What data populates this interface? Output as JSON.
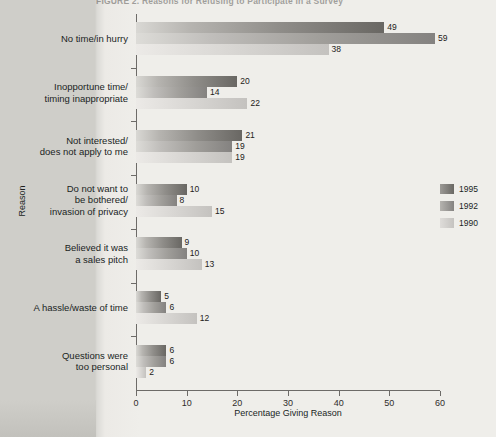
{
  "figure": {
    "title": "FIGURE 2.  Reasons for Refusing to Participate in a Survey",
    "title_clipped": true
  },
  "chart_data": {
    "type": "bar",
    "orientation": "horizontal",
    "title": "FIGURE 2.  Reasons for Refusing to Participate in a Survey",
    "xlabel": "Percentage Giving Reason",
    "ylabel": "Reason",
    "xlim": [
      0,
      60
    ],
    "xticks": [
      0,
      10,
      20,
      30,
      40,
      50,
      60
    ],
    "grid": false,
    "legend_position": "right",
    "categories": [
      "No time/in hurry",
      "Inopportune time/ timing inappropriate",
      "Not interested/ does not apply to me",
      "Do not want to be bothered/ invasion of privacy",
      "Believed it was a sales pitch",
      "A hassle/waste of time",
      "Questions were too personal"
    ],
    "series": [
      {
        "name": "1995",
        "color": "#6a6864",
        "values": [
          49,
          20,
          21,
          10,
          9,
          5,
          6
        ]
      },
      {
        "name": "1992",
        "color": "#858381",
        "values": [
          59,
          14,
          19,
          8,
          10,
          6,
          6
        ]
      },
      {
        "name": "1990",
        "color": "#c5c3c0",
        "values": [
          38,
          22,
          19,
          15,
          13,
          12,
          2
        ]
      }
    ]
  },
  "categories_display": [
    [
      "No time/in hurry"
    ],
    [
      "Inopportune time/",
      "timing inappropriate"
    ],
    [
      "Not interested/",
      "does not apply to me"
    ],
    [
      "Do not want to",
      "be bothered/",
      "invasion of privacy"
    ],
    [
      "Believed it was",
      "a sales pitch"
    ],
    [
      "A hassle/waste of time"
    ],
    [
      "Questions were",
      "too personal"
    ]
  ],
  "axes": {
    "x_title": "Percentage Giving Reason",
    "y_title": "Reason",
    "x_ticks": [
      "0",
      "10",
      "20",
      "30",
      "40",
      "50",
      "60"
    ]
  },
  "legend": {
    "items": [
      {
        "label": "1995",
        "series": "1995"
      },
      {
        "label": "1992",
        "series": "1992"
      },
      {
        "label": "1990",
        "series": "1990"
      }
    ]
  }
}
